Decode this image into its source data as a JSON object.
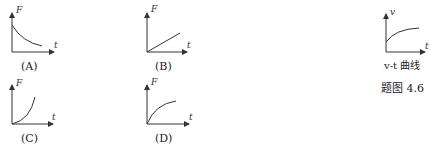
{
  "graphs": [
    {
      "id": "A",
      "label": "(A)",
      "ylabel": "F",
      "xlabel": "t",
      "shape": "decreasing-concave-up"
    },
    {
      "id": "B",
      "label": "(B)",
      "ylabel": "F",
      "xlabel": "t",
      "shape": "linear-increasing"
    },
    {
      "id": "C",
      "label": "(C)",
      "ylabel": "F",
      "xlabel": "t",
      "shape": "increasing-concave-up"
    },
    {
      "id": "D",
      "label": "(D)",
      "ylabel": "F",
      "xlabel": "t",
      "shape": "increasing-concave-down"
    }
  ],
  "reference": {
    "ylabel": "v",
    "xlabel": "t",
    "caption": "v-t 曲线",
    "shape": "increasing-concave-down-from-positive"
  },
  "figure_caption": "题图 4.6"
}
